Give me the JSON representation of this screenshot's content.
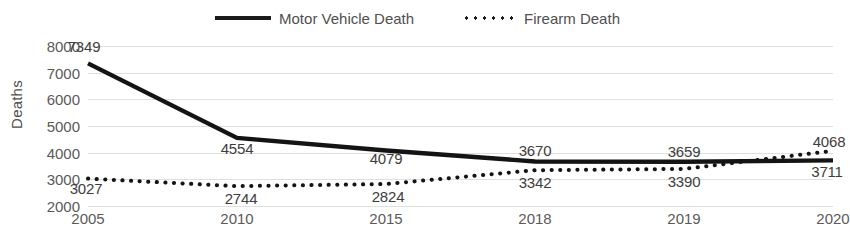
{
  "chart_data": {
    "type": "line",
    "title": "",
    "xlabel": "",
    "ylabel": "Deaths",
    "categories": [
      "2005",
      "2010",
      "2015",
      "2018",
      "2019",
      "2020"
    ],
    "ylim": [
      2000,
      8000
    ],
    "ytick_labels": [
      "8000",
      "7000",
      "6000",
      "5000",
      "4000",
      "3000",
      "2000"
    ],
    "ytick_values": [
      8000,
      7000,
      6000,
      5000,
      4000,
      3000,
      2000
    ],
    "grid": true,
    "legend_position": "top-center",
    "series": [
      {
        "name": "Motor Vehicle Death",
        "style": "solid",
        "values": [
          7349,
          4554,
          4079,
          3670,
          3659,
          3711
        ],
        "labels": [
          "7349",
          "4554",
          "4079",
          "3670",
          "3659",
          "3711"
        ]
      },
      {
        "name": "Firearm Death",
        "style": "dotted",
        "values": [
          3027,
          2744,
          2824,
          3342,
          3390,
          4068
        ],
        "labels": [
          "3027",
          "2744",
          "2824",
          "3342",
          "3390",
          "4068"
        ]
      }
    ]
  },
  "legend": {
    "entries": [
      {
        "label": "Motor Vehicle Death",
        "key": "solid-line-key-icon"
      },
      {
        "label": "Firearm Death",
        "key": "dotted-line-key-icon"
      }
    ]
  }
}
